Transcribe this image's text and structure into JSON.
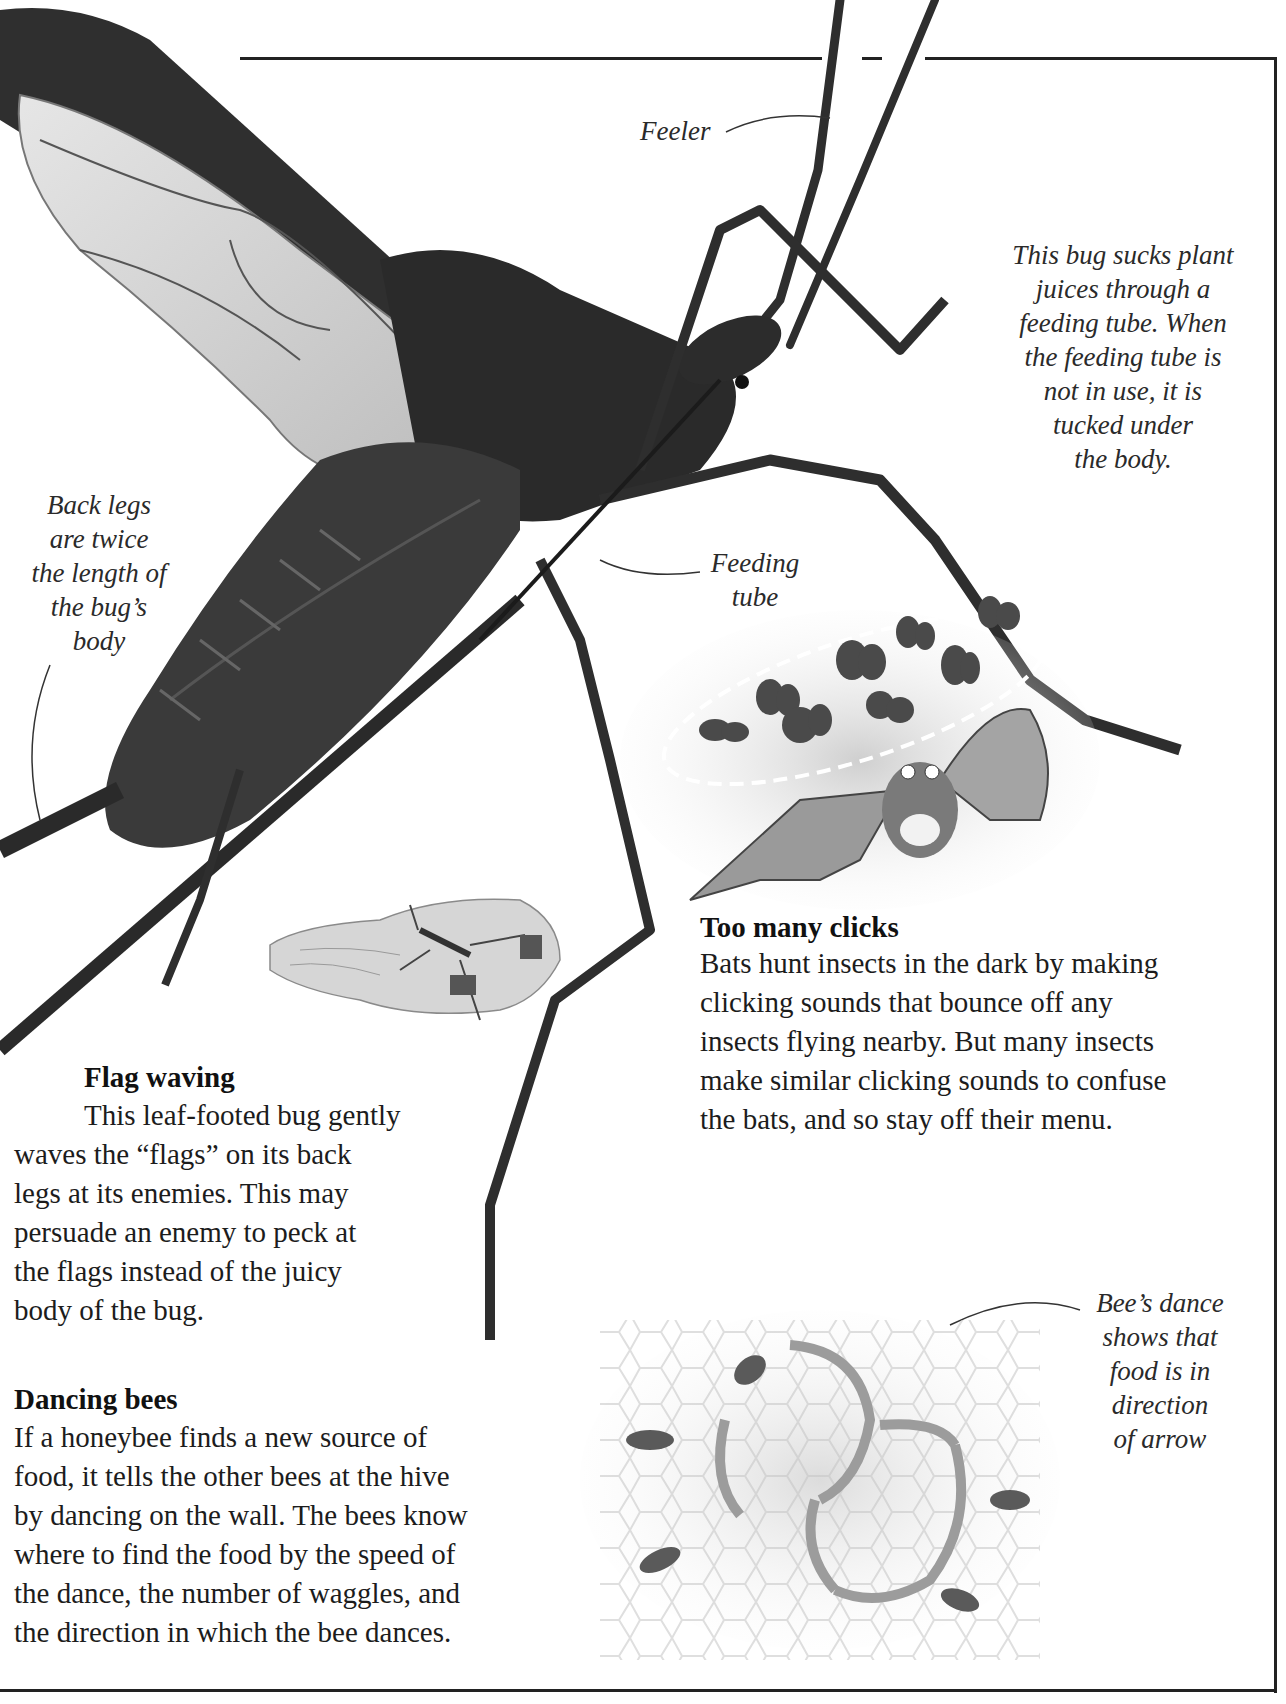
{
  "page": {
    "frame": {
      "stroke": "#222222"
    },
    "labels": {
      "feeler": "Feeler",
      "feeding_tube_note": "This bug sucks plant\njuices through a\nfeeding tube. When\nthe feeding tube is\nnot in use, it is\ntucked under\nthe body.",
      "back_legs": "Back legs\nare twice\nthe length of\nthe bug’s\nbody",
      "feeding_tube": "Feeding\ntube",
      "bee_dance": "Bee’s dance\nshows that\nfood is in\ndirection\nof arrow"
    },
    "sections": {
      "too_many_clicks": {
        "heading": "Too many clicks",
        "body": "Bats hunt insects in the dark by making\nclicking sounds that bounce off any\ninsects flying nearby. But many insects\nmake similar clicking sounds to confuse\nthe bats, and so stay off their menu."
      },
      "flag_waving": {
        "heading": "Flag waving",
        "body_first": "This leaf-footed bug gently",
        "body_rest": "waves the “flags” on its back\nlegs at its enemies. This may\npersuade an enemy to peck at\nthe flags instead of the juicy\nbody of the bug."
      },
      "dancing_bees": {
        "heading": "Dancing bees",
        "body": "If a honeybee finds a new source of\nfood, it tells the other bees at the hive\nby dancing on the wall. The bees know\nwhere to find the food by the speed of\nthe dance, the number of waggles, and\nthe direction in which the bee dances."
      }
    },
    "illustrations": {
      "main_bug": "assassin-bug-photo",
      "bat": "bat-hunting-moths",
      "hand": "leaf-footed-bug-on-hand",
      "bees": "honeybee-waggle-dance"
    }
  }
}
